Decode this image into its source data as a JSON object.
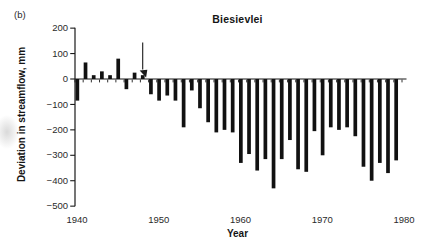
{
  "figure": {
    "panel_label": "(b)",
    "title": "Biesievlei",
    "xlabel": "Year",
    "ylabel": "Deviation in streamflow, mm"
  },
  "chart_data": {
    "type": "bar",
    "title": "Biesievlei",
    "xlabel": "Year",
    "ylabel": "Deviation in streamflow, mm",
    "ylim": [
      -500,
      200
    ],
    "xlim": [
      1940,
      1980
    ],
    "y_ticks": [
      200,
      100,
      0,
      -100,
      -200,
      -300,
      -400,
      -500
    ],
    "x_ticks": [
      1940,
      1950,
      1960,
      1970,
      1980
    ],
    "minor_x_tick_every_years": 1,
    "grid": false,
    "bar_color": "#111111",
    "axis_color": "#1a1a1a",
    "tick_label_color": "#2a2a2a",
    "years": [
      1940,
      1941,
      1942,
      1943,
      1944,
      1945,
      1946,
      1947,
      1948,
      1949,
      1950,
      1951,
      1952,
      1953,
      1954,
      1955,
      1956,
      1957,
      1958,
      1959,
      1960,
      1961,
      1962,
      1963,
      1964,
      1965,
      1966,
      1967,
      1968,
      1969,
      1970,
      1971,
      1972,
      1973,
      1974,
      1975,
      1976,
      1977,
      1978,
      1979
    ],
    "values": [
      -85,
      65,
      15,
      30,
      15,
      80,
      -40,
      25,
      15,
      -60,
      -85,
      -65,
      -85,
      -190,
      -45,
      -115,
      -170,
      -210,
      -200,
      -210,
      -330,
      -295,
      -360,
      -315,
      -430,
      -315,
      -240,
      -355,
      -365,
      -205,
      -300,
      -190,
      -200,
      -190,
      -225,
      -345,
      -400,
      -330,
      -370,
      -320
    ],
    "annotation": {
      "type": "arrow",
      "target_year": 1948,
      "direction": "down-right onto top of 1948 bar"
    }
  }
}
